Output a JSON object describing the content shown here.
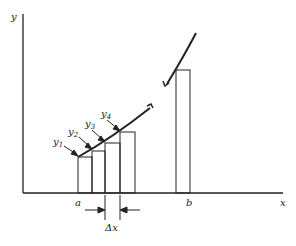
{
  "diagram": {
    "type": "riemann-sum-illustration",
    "axes": {
      "x_label": "x",
      "y_label": "y"
    },
    "interval": {
      "start_label": "a",
      "end_label": "b"
    },
    "width_label": "Δx",
    "ordinates": [
      {
        "base": "y",
        "sub": "1"
      },
      {
        "base": "y",
        "sub": "2"
      },
      {
        "base": "y",
        "sub": "3"
      },
      {
        "base": "y",
        "sub": "4"
      }
    ],
    "colors": {
      "stroke": "#222222",
      "background": "#ffffff"
    }
  }
}
